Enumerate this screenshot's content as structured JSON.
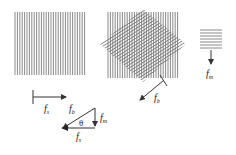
{
  "diagram": {
    "colors": {
      "grating_line": "#8a8a8a",
      "overlay_line": "#6f6f6f",
      "arrow": "#333333",
      "text": "#222222"
    },
    "panels": [
      {
        "id": "sample-grating",
        "type": "vertical-grating",
        "vector_label": {
          "symbol": "f",
          "subscript": "s"
        },
        "vector_direction": "right"
      },
      {
        "id": "superimposed-gratings",
        "type": "vertical-plus-rotated-grating",
        "vector_label": {
          "symbol": "f",
          "subscript": "b"
        },
        "vector_direction": "down-left"
      },
      {
        "id": "moire-fringes",
        "type": "horizontal-grating",
        "vector_label": {
          "symbol": "f",
          "subscript": "m"
        },
        "vector_direction": "down"
      }
    ],
    "vector_triangle": {
      "hypotenuse": {
        "symbol": "f",
        "subscript": "b"
      },
      "vertical_leg": {
        "symbol": "f",
        "subscript": "m"
      },
      "horizontal_leg": {
        "symbol": "f",
        "subscript": "s"
      },
      "angle": "θ"
    }
  }
}
